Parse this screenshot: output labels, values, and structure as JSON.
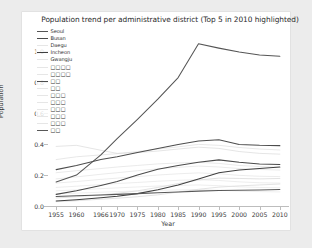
{
  "chart_data": {
    "type": "line",
    "title": "Population trend per administrative district (Top 5 in 2010 highlighted)",
    "xlabel": "Year",
    "ylabel": "Population",
    "x": [
      1955,
      1960,
      1966,
      1970,
      1975,
      1980,
      1985,
      1990,
      1995,
      2000,
      2005,
      2010
    ],
    "xlim": [
      1953,
      2012
    ],
    "ylim": [
      0.0,
      1.15
    ],
    "xticks": [
      "1955",
      "1960",
      "1966",
      "1970",
      "1975",
      "1980",
      "1985",
      "1990",
      "1995",
      "2000",
      "2005",
      "2010"
    ],
    "yticks": [
      "0.0",
      "0.2",
      "0.4",
      "0.6",
      "0.8",
      "1.0"
    ],
    "grid": false,
    "legend_position": "upper left",
    "highlight_note": "Top 5 in 2010 highlighted",
    "series": [
      {
        "name": "Seoul",
        "highlighted": true,
        "color": "#555555",
        "values": [
          0.155,
          0.2,
          0.33,
          0.435,
          0.56,
          0.69,
          0.83,
          1.048,
          1.02,
          0.995,
          0.975,
          0.968
        ]
      },
      {
        "name": "Busan",
        "highlighted": true,
        "color": "#4a4a4a",
        "values": [
          0.075,
          0.098,
          0.133,
          0.158,
          0.2,
          0.238,
          0.262,
          0.282,
          0.298,
          0.283,
          0.272,
          0.268
        ]
      },
      {
        "name": "Daegu",
        "highlighted": false,
        "color": "#c9c9c9",
        "values": [
          0.052,
          0.06,
          0.072,
          0.082,
          0.098,
          0.12,
          0.145,
          0.168,
          0.18,
          0.178,
          0.175,
          0.178
        ]
      },
      {
        "name": "Incheon",
        "highlighted": true,
        "color": "#3f3f3f",
        "values": [
          0.032,
          0.04,
          0.053,
          0.063,
          0.08,
          0.105,
          0.135,
          0.175,
          0.215,
          0.232,
          0.242,
          0.252
        ]
      },
      {
        "name": "Gwangju",
        "highlighted": false,
        "color": "#cccccc",
        "values": [
          0.028,
          0.034,
          0.044,
          0.05,
          0.06,
          0.072,
          0.09,
          0.108,
          0.122,
          0.13,
          0.136,
          0.142
        ]
      },
      {
        "name": "□□□□",
        "highlighted": false,
        "color": "#d0d0d0",
        "values": [
          0.385,
          0.392,
          0.36,
          0.34,
          0.345,
          0.355,
          0.368,
          0.38,
          0.372,
          0.352,
          0.34,
          0.335
        ]
      },
      {
        "name": "□□□□",
        "highlighted": false,
        "color": "#d4d4d4",
        "values": [
          0.3,
          0.318,
          0.33,
          0.338,
          0.352,
          0.368,
          0.382,
          0.398,
          0.392,
          0.378,
          0.368,
          0.362
        ]
      },
      {
        "name": "□□",
        "highlighted": true,
        "color": "#4d4d4d",
        "values": [
          0.235,
          0.262,
          0.3,
          0.318,
          0.345,
          0.372,
          0.398,
          0.42,
          0.428,
          0.398,
          0.392,
          0.39
        ]
      },
      {
        "name": "□□",
        "highlighted": false,
        "color": "#d8d8d8",
        "values": [
          0.215,
          0.228,
          0.242,
          0.252,
          0.262,
          0.272,
          0.278,
          0.282,
          0.275,
          0.262,
          0.255,
          0.25
        ]
      },
      {
        "name": "□□□",
        "highlighted": false,
        "color": "#dadada",
        "values": [
          0.175,
          0.188,
          0.205,
          0.215,
          0.228,
          0.24,
          0.25,
          0.258,
          0.252,
          0.242,
          0.236,
          0.232
        ]
      },
      {
        "name": "□□□",
        "highlighted": false,
        "color": "#dcdcdc",
        "values": [
          0.148,
          0.158,
          0.172,
          0.18,
          0.19,
          0.2,
          0.208,
          0.214,
          0.208,
          0.198,
          0.192,
          0.19
        ]
      },
      {
        "name": "□□□",
        "highlighted": false,
        "color": "#dedede",
        "values": [
          0.12,
          0.128,
          0.138,
          0.145,
          0.152,
          0.16,
          0.166,
          0.17,
          0.165,
          0.156,
          0.15,
          0.148
        ]
      },
      {
        "name": "□□□",
        "highlighted": false,
        "color": "#e0e0e0",
        "values": [
          0.098,
          0.104,
          0.112,
          0.117,
          0.123,
          0.129,
          0.133,
          0.136,
          0.131,
          0.124,
          0.12,
          0.118
        ]
      },
      {
        "name": "□□□",
        "highlighted": false,
        "color": "#e2e2e2",
        "values": [
          0.078,
          0.083,
          0.089,
          0.093,
          0.097,
          0.101,
          0.104,
          0.106,
          0.102,
          0.096,
          0.093,
          0.091
        ]
      },
      {
        "name": "□□",
        "highlighted": true,
        "color": "#585858",
        "values": [
          0.062,
          0.066,
          0.071,
          0.075,
          0.08,
          0.085,
          0.09,
          0.096,
          0.1,
          0.102,
          0.104,
          0.107
        ]
      }
    ]
  }
}
